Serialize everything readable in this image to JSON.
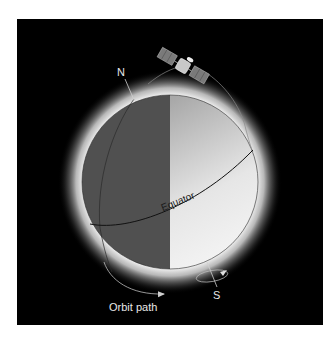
{
  "figure": {
    "labels": {
      "north": "N",
      "south": "S",
      "equator": "Equator",
      "orbit": "Orbit path"
    },
    "objects": {
      "satellite": "satellite-icon",
      "globe": "earth-globe"
    },
    "colors": {
      "background": "#000000",
      "night_side": "#505050",
      "day_side_light": "#f2f2f2",
      "day_side_dark": "#a8a8a8",
      "glow": "#ffffff",
      "label_text": "#e8e8e8",
      "line": "#202020"
    }
  }
}
